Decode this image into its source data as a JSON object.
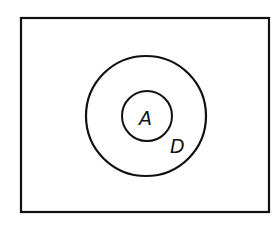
{
  "diagram": {
    "type": "venn",
    "universe": {
      "label": ""
    },
    "sets": [
      {
        "id": "D",
        "label": "D",
        "contains": [
          "A"
        ]
      },
      {
        "id": "A",
        "label": "A"
      }
    ],
    "colors": {
      "stroke": "#111111",
      "background": "#ffffff"
    }
  }
}
